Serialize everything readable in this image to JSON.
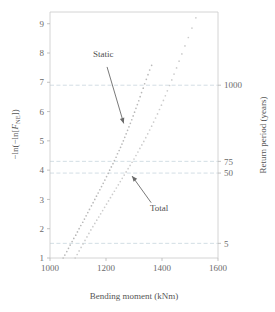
{
  "chart_data": {
    "type": "scatter",
    "title": "",
    "xlabel": "Bending moment (kNm)",
    "ylabel": "−ln(−ln[F_NE])",
    "y2label": "Return period (years)",
    "xlim": [
      1000,
      1600
    ],
    "ylim": [
      1,
      9.4
    ],
    "xticks": [
      1000,
      1200,
      1400,
      1600
    ],
    "xticklabels": [
      "1000",
      "1200",
      "1400",
      "1600"
    ],
    "yticks": [
      1,
      2,
      3,
      4,
      5,
      6,
      7,
      8,
      9
    ],
    "yticklabels": [
      "1",
      "2",
      "3",
      "4",
      "5",
      "6",
      "7",
      "8",
      "9"
    ],
    "y2ticks": [
      6.9,
      4.3,
      3.9,
      1.5
    ],
    "y2ticklabels": [
      "1000",
      "75",
      "50",
      "5"
    ],
    "grid": true,
    "grid_axis": "y",
    "grid_values": [
      6.9,
      4.3,
      3.9,
      1.5
    ],
    "legend_position": "none",
    "annotations": [
      {
        "text": "Static",
        "text_x": 1190,
        "text_y": 7.85,
        "arrow_to_x": 1268,
        "arrow_to_y": 5.45
      },
      {
        "text": "Total",
        "text_x": 1390,
        "text_y": 2.62,
        "arrow_to_x": 1283,
        "arrow_to_y": 3.92
      }
    ],
    "series": [
      {
        "name": "Static",
        "color": "#b9b9b9",
        "marker": "dot",
        "points": [
          [
            1047,
            1.0
          ],
          [
            1053,
            1.1
          ],
          [
            1060,
            1.22
          ],
          [
            1066,
            1.33
          ],
          [
            1072,
            1.44
          ],
          [
            1079,
            1.56
          ],
          [
            1085,
            1.67
          ],
          [
            1092,
            1.78
          ],
          [
            1098,
            1.89
          ],
          [
            1104,
            2.0
          ],
          [
            1110,
            2.11
          ],
          [
            1117,
            2.22
          ],
          [
            1123,
            2.33
          ],
          [
            1129,
            2.44
          ],
          [
            1135,
            2.55
          ],
          [
            1141,
            2.66
          ],
          [
            1148,
            2.78
          ],
          [
            1154,
            2.89
          ],
          [
            1160,
            3.0
          ],
          [
            1166,
            3.11
          ],
          [
            1172,
            3.22
          ],
          [
            1178,
            3.33
          ],
          [
            1184,
            3.44
          ],
          [
            1190,
            3.55
          ],
          [
            1196,
            3.66
          ],
          [
            1202,
            3.78
          ],
          [
            1208,
            3.89
          ],
          [
            1213,
            4.0
          ],
          [
            1219,
            4.11
          ],
          [
            1225,
            4.22
          ],
          [
            1230,
            4.33
          ],
          [
            1236,
            4.44
          ],
          [
            1241,
            4.56
          ],
          [
            1247,
            4.67
          ],
          [
            1252,
            4.78
          ],
          [
            1257,
            4.89
          ],
          [
            1262,
            5.0
          ],
          [
            1267,
            5.12
          ],
          [
            1272,
            5.24
          ],
          [
            1277,
            5.36
          ],
          [
            1282,
            5.48
          ],
          [
            1287,
            5.6
          ],
          [
            1292,
            5.72
          ],
          [
            1297,
            5.85
          ],
          [
            1302,
            5.98
          ],
          [
            1307,
            6.11
          ],
          [
            1312,
            6.24
          ],
          [
            1317,
            6.37
          ],
          [
            1322,
            6.51
          ],
          [
            1327,
            6.65
          ],
          [
            1333,
            6.8
          ],
          [
            1338,
            6.95
          ],
          [
            1344,
            7.1
          ],
          [
            1350,
            7.26
          ],
          [
            1356,
            7.42
          ],
          [
            1363,
            7.58
          ]
        ]
      },
      {
        "name": "Total",
        "color": "#cccccc",
        "marker": "dot",
        "points": [
          [
            1090,
            1.0
          ],
          [
            1097,
            1.12
          ],
          [
            1104,
            1.24
          ],
          [
            1111,
            1.36
          ],
          [
            1118,
            1.48
          ],
          [
            1125,
            1.6
          ],
          [
            1132,
            1.72
          ],
          [
            1139,
            1.84
          ],
          [
            1146,
            1.96
          ],
          [
            1153,
            2.07
          ],
          [
            1160,
            2.18
          ],
          [
            1167,
            2.29
          ],
          [
            1174,
            2.4
          ],
          [
            1181,
            2.51
          ],
          [
            1188,
            2.62
          ],
          [
            1195,
            2.73
          ],
          [
            1202,
            2.84
          ],
          [
            1209,
            2.95
          ],
          [
            1216,
            3.06
          ],
          [
            1223,
            3.17
          ],
          [
            1230,
            3.28
          ],
          [
            1237,
            3.39
          ],
          [
            1244,
            3.5
          ],
          [
            1251,
            3.61
          ],
          [
            1258,
            3.72
          ],
          [
            1265,
            3.83
          ],
          [
            1272,
            3.94
          ],
          [
            1279,
            4.05
          ],
          [
            1286,
            4.16
          ],
          [
            1293,
            4.27
          ],
          [
            1300,
            4.38
          ],
          [
            1307,
            4.5
          ],
          [
            1314,
            4.62
          ],
          [
            1321,
            4.74
          ],
          [
            1328,
            4.86
          ],
          [
            1335,
            4.98
          ],
          [
            1342,
            5.11
          ],
          [
            1349,
            5.24
          ],
          [
            1356,
            5.37
          ],
          [
            1363,
            5.5
          ],
          [
            1370,
            5.64
          ],
          [
            1377,
            5.78
          ],
          [
            1384,
            5.92
          ],
          [
            1391,
            6.07
          ],
          [
            1398,
            6.22
          ],
          [
            1405,
            6.38
          ],
          [
            1412,
            6.54
          ],
          [
            1419,
            6.71
          ],
          [
            1427,
            6.89
          ],
          [
            1435,
            7.08
          ],
          [
            1443,
            7.28
          ],
          [
            1452,
            7.49
          ],
          [
            1461,
            7.72
          ],
          [
            1471,
            7.97
          ],
          [
            1482,
            8.24
          ],
          [
            1494,
            8.53
          ],
          [
            1507,
            8.85
          ],
          [
            1521,
            9.2
          ]
        ]
      }
    ]
  }
}
